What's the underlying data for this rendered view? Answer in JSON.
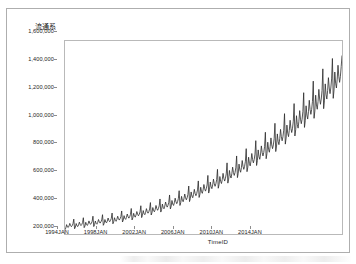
{
  "figure": {
    "background_color": "#ffffff",
    "frame_color": "#aeaeae",
    "plot_border_color": "#b9b9b9",
    "axis_text_color": "#1d1d1d"
  },
  "chart_data": {
    "type": "line",
    "title": "",
    "subtitle": "",
    "xlabel": "TimeID",
    "ylabel": "流通系",
    "line_color": "#2b2b2b",
    "line_width": 0.8,
    "grid": false,
    "legend": null,
    "legend_position": "none",
    "xlim": [
      "1994JAN",
      "2016JUN"
    ],
    "ylim": [
      200000,
      1600000
    ],
    "x_tick_labels": [
      "1994JAN",
      "1998JAN",
      "2002JAN",
      "2006JAN",
      "2010JAN",
      "2014JAN"
    ],
    "y_tick_labels": [
      "200,000",
      "400,000",
      "600,000",
      "800,000",
      "1,000,000",
      "1,200,000",
      "1,400,000",
      "1,600,000"
    ],
    "y_tick_values": [
      200000,
      400000,
      600000,
      800000,
      1000000,
      1200000,
      1400000,
      1600000
    ],
    "x_frequency": "monthly",
    "x_start": "1994-01",
    "x_end": "2016-06",
    "values": [
      232000,
      243000,
      268000,
      252000,
      247000,
      258000,
      277000,
      262000,
      253000,
      261000,
      274000,
      308000,
      238000,
      250000,
      276000,
      259000,
      254000,
      266000,
      286000,
      270000,
      261000,
      269000,
      283000,
      318000,
      246000,
      258000,
      285000,
      268000,
      262000,
      275000,
      295000,
      279000,
      270000,
      278000,
      292000,
      329000,
      254000,
      267000,
      294000,
      277000,
      271000,
      284000,
      305000,
      288000,
      279000,
      288000,
      302000,
      340000,
      263000,
      276000,
      305000,
      287000,
      281000,
      294000,
      316000,
      299000,
      289000,
      298000,
      313000,
      352000,
      274000,
      288000,
      318000,
      299000,
      292000,
      306000,
      329000,
      311000,
      301000,
      311000,
      326000,
      367000,
      287000,
      301000,
      333000,
      313000,
      306000,
      321000,
      345000,
      326000,
      315000,
      325000,
      342000,
      385000,
      302000,
      317000,
      350000,
      330000,
      322000,
      338000,
      363000,
      343000,
      332000,
      343000,
      360000,
      405000,
      319000,
      335000,
      370000,
      348000,
      340000,
      357000,
      384000,
      362000,
      351000,
      362000,
      381000,
      428000,
      338000,
      355000,
      392000,
      369000,
      361000,
      378000,
      407000,
      384000,
      372000,
      384000,
      404000,
      454000,
      359000,
      377000,
      417000,
      392000,
      383000,
      402000,
      432000,
      408000,
      395000,
      408000,
      429000,
      483000,
      382000,
      401000,
      443000,
      417000,
      407000,
      427000,
      460000,
      434000,
      420000,
      434000,
      457000,
      514000,
      407000,
      428000,
      473000,
      445000,
      434000,
      456000,
      490000,
      463000,
      448000,
      463000,
      487000,
      548000,
      435000,
      457000,
      505000,
      475000,
      463000,
      487000,
      524000,
      494000,
      478000,
      494000,
      520000,
      585000,
      465000,
      488000,
      539000,
      507000,
      495000,
      520000,
      559000,
      528000,
      511000,
      528000,
      556000,
      625000,
      497000,
      522000,
      577000,
      543000,
      529000,
      556000,
      598000,
      564000,
      546000,
      564000,
      594000,
      669000,
      532000,
      559000,
      617000,
      581000,
      566000,
      595000,
      640000,
      604000,
      584000,
      604000,
      636000,
      716000,
      569000,
      598000,
      661000,
      622000,
      606000,
      637000,
      685000,
      646000,
      625000,
      646000,
      680000,
      766000,
      609000,
      640000,
      707000,
      666000,
      648000,
      681000,
      733000,
      691000,
      669000,
      691000,
      728000,
      819000,
      652000,
      685000,
      757000,
      712000,
      694000,
      729000,
      784000,
      740000,
      716000,
      740000,
      779000,
      877000,
      697000,
      733000,
      810000,
      762000,
      742000,
      780000,
      839000,
      791000,
      766000,
      791000,
      833000,
      938000,
      746000,
      784000,
      866000,
      815000,
      793000,
      834000,
      897000,
      846000,
      819000,
      846000,
      891000,
      1003000,
      798000,
      838000,
      926000,
      871000,
      848000,
      891000,
      959000,
      905000,
      876000,
      905000,
      953000,
      1073000,
      852000,
      896000,
      990000,
      931000,
      906000,
      952000,
      1025000,
      967000,
      936000,
      967000,
      1018000,
      1146000,
      911000,
      957000,
      1058000,
      995000,
      968000,
      1018000,
      1095000,
      1033000,
      1000000,
      1033000,
      1088000,
      1225000,
      973000,
      1022000,
      1130000,
      1063000,
      1034000,
      1087000,
      1170000,
      1104000,
      1068000,
      1104000,
      1162000,
      1309000,
      1039000,
      1092000,
      1207000,
      1136000,
      1105000,
      1161000,
      1249000,
      1179000,
      1141000,
      1179000,
      1241000,
      1398000,
      1109000,
      1166000,
      1289000,
      1212000,
      1179000,
      1240000,
      1334000,
      1259000,
      1218000,
      1259000,
      1325000,
      1473000,
      1184000,
      1244000,
      1375000,
      1294000,
      1259000,
      1323000,
      1424000,
      1344000,
      1300000,
      1344000,
      1415000,
      1492000
    ]
  }
}
